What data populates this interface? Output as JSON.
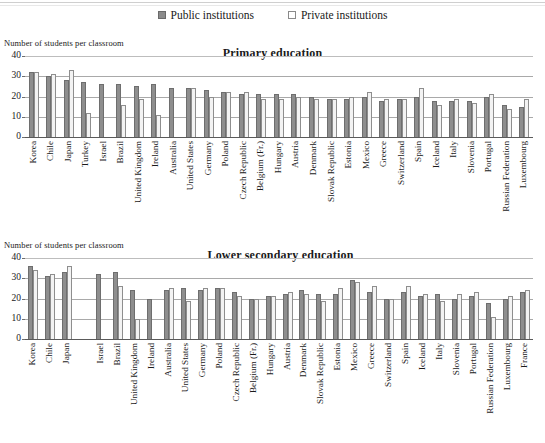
{
  "legend": {
    "items": [
      {
        "icon": "filled-square-icon",
        "label": "Public institutions",
        "color": "#8b8b8b"
      },
      {
        "icon": "empty-square-icon",
        "label": "Private institutions",
        "color": "#ffffff"
      }
    ]
  },
  "chart_data": [
    {
      "type": "bar",
      "title": "Primary education",
      "ylabel": "Number of students per classroom",
      "xlabel": "",
      "ylim": [
        0,
        40
      ],
      "yticks": [
        0,
        10,
        20,
        30,
        40
      ],
      "grid": true,
      "legend_position": "top-center",
      "categories": [
        "Korea",
        "Chile",
        "Japan",
        "Turkey",
        "Israel",
        "Brazil",
        "United Kingdom",
        "Ireland",
        "Australia",
        "United States",
        "Germany",
        "Poland",
        "Czech Republic",
        "Belgium (Fr.)",
        "Hungary",
        "Austria",
        "Denmark",
        "Slovak Republic",
        "Estonia",
        "Mexico",
        "Greece",
        "Switzerland",
        "Spain",
        "Iceland",
        "Italy",
        "Slovenia",
        "Portugal",
        "Russian Federation",
        "Luxembourg"
      ],
      "series": [
        {
          "name": "Public institutions",
          "values": [
            32,
            30,
            28,
            27,
            26,
            26,
            25,
            26,
            24,
            24,
            23,
            22,
            21,
            21,
            21,
            21,
            20,
            19,
            19,
            20,
            18,
            19,
            20,
            18,
            18,
            18,
            20,
            16,
            15
          ]
        },
        {
          "name": "Private institutions",
          "values": [
            32,
            31,
            33,
            12,
            null,
            16,
            19,
            11,
            null,
            24,
            20,
            22,
            22,
            19,
            19,
            20,
            19,
            19,
            20,
            22,
            19,
            19,
            24,
            16,
            19,
            17,
            21,
            14,
            19
          ]
        }
      ]
    },
    {
      "type": "bar",
      "title": "Lower secondary education",
      "ylabel": "Number of students per classroom",
      "xlabel": "",
      "ylim": [
        0,
        40
      ],
      "yticks": [
        0,
        10,
        20,
        30,
        40
      ],
      "grid": true,
      "legend_position": "top-center",
      "categories": [
        "Korea",
        "Chile",
        "Japan",
        "",
        "Israel",
        "Brazil",
        "United Kingdom",
        "Ireland",
        "Australia",
        "United States",
        "Germany",
        "Poland",
        "Czech Republic",
        "Belgium (Fr.)",
        "Hungary",
        "Austria",
        "Denmark",
        "Slovak Republic",
        "Estonia",
        "Mexico",
        "Greece",
        "Switzerland",
        "Spain",
        "Iceland",
        "Italy",
        "Slovenia",
        "Portugal",
        "Russian Federation",
        "Luxembourg",
        "France"
      ],
      "series": [
        {
          "name": "Public institutions",
          "values": [
            36,
            31,
            33,
            null,
            32,
            33,
            24,
            20,
            24,
            25,
            24,
            25,
            23,
            20,
            21,
            22,
            24,
            22,
            22,
            29,
            23,
            20,
            23,
            21,
            22,
            20,
            21,
            18,
            20,
            23
          ]
        },
        {
          "name": "Private institutions",
          "values": [
            34,
            32,
            36,
            null,
            null,
            26,
            10,
            null,
            25,
            19,
            25,
            25,
            21,
            20,
            21,
            23,
            22,
            19,
            25,
            28,
            26,
            20,
            26,
            22,
            19,
            22,
            23,
            11,
            21,
            24
          ]
        }
      ]
    }
  ]
}
